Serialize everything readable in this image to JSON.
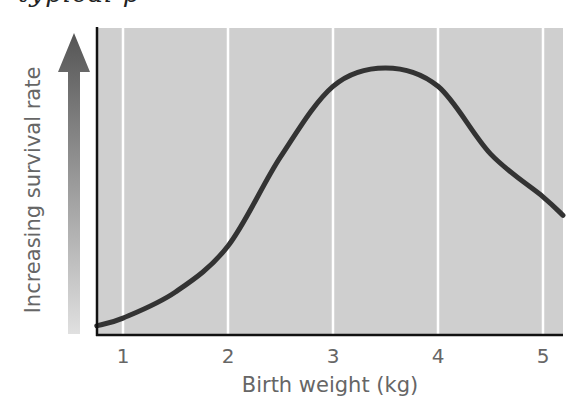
{
  "caption_fragment": "typical    p",
  "colors": {
    "plot_background": "#cfcfcf",
    "gridline": "#ffffff",
    "axis": "#111111",
    "curve": "#333333",
    "label_text": "#666666",
    "arrow_top": "#555555",
    "arrow_bottom": "#e0e0e0"
  },
  "y_arrow": {
    "label": "Increasing survival rate",
    "icon": "up-arrow-gradient-icon"
  },
  "chart_data": {
    "type": "line",
    "title": "",
    "xlabel": "Birth weight (kg)",
    "ylabel": "Increasing survival rate",
    "xlim": [
      0.75,
      5.19
    ],
    "ylim": [
      0,
      1
    ],
    "x_ticks": [
      1,
      2,
      3,
      4,
      5
    ],
    "x_tick_labels": [
      "1",
      "2",
      "3",
      "4",
      "5"
    ],
    "y_ticks": [],
    "grid": {
      "vertical": true,
      "horizontal": false
    },
    "legend": null,
    "series": [
      {
        "name": "Survival rate",
        "x": [
          0.75,
          1.0,
          1.5,
          2.0,
          2.5,
          3.0,
          3.5,
          4.0,
          4.5,
          5.0,
          5.19
        ],
        "values": [
          0.03,
          0.055,
          0.14,
          0.29,
          0.58,
          0.81,
          0.87,
          0.81,
          0.59,
          0.45,
          0.39
        ]
      }
    ],
    "annotations": [
      "Relative survival scale (no numeric y values shown); peak near 3.5 kg"
    ]
  }
}
